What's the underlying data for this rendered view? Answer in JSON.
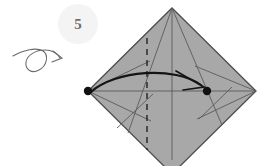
{
  "figure": {
    "kind": "origami-fold-diagram",
    "step_number": "5",
    "step_badge": {
      "shape": "circle",
      "center_x": 78,
      "center_y": 24,
      "radius": 20,
      "fill": "#f2f2f2"
    },
    "turn_over_symbol": {
      "name": "turn-over-arrow",
      "description": "loop arrow indicating turn the paper over",
      "stroke": "#6b6b6b"
    },
    "colors": {
      "paper_fill": "#a8a8a8",
      "paper_edge": "#4d4d4d",
      "crease_line": "#5a5a5a",
      "valley_dash": "#2b2b2b",
      "action_arrow": "#1a1a1a",
      "reference_dot": "#111111",
      "background": "#ffffff",
      "badge_fill": "#f2f2f2",
      "badge_text": "#6e6e6e"
    },
    "shape": {
      "name": "diamond-paper",
      "vertices": [
        {
          "name": "top",
          "x": 172,
          "y": 8
        },
        {
          "name": "right",
          "x": 256,
          "y": 91
        },
        {
          "name": "bottom",
          "x": 172,
          "y": 174
        },
        {
          "name": "left",
          "x": 88,
          "y": 91
        }
      ]
    },
    "reference_dots": [
      {
        "name": "left-reference-dot",
        "x": 88,
        "y": 91,
        "r": 4.2
      },
      {
        "name": "right-reference-dot",
        "x": 207,
        "y": 91,
        "r": 4.2
      }
    ],
    "creases": [
      {
        "name": "horizontal-center-crease",
        "x1": 88,
        "y1": 91,
        "x2": 256,
        "y2": 91,
        "style": "solid"
      },
      {
        "name": "vertical-center-crease",
        "x1": 172,
        "y1": 8,
        "x2": 172,
        "y2": 160,
        "style": "solid"
      },
      {
        "name": "diagonal-top-to-left-lower",
        "x1": 172,
        "y1": 8,
        "x2": 128,
        "y2": 133,
        "style": "solid"
      },
      {
        "name": "diagonal-top-to-right-lower",
        "x1": 172,
        "y1": 8,
        "x2": 222,
        "y2": 125,
        "style": "solid"
      },
      {
        "name": "left-fold-edge-upper",
        "x1": 88,
        "y1": 91,
        "x2": 147,
        "y2": 62,
        "style": "solid"
      },
      {
        "name": "left-fold-edge-lower",
        "x1": 88,
        "y1": 91,
        "x2": 150,
        "y2": 120,
        "style": "solid"
      },
      {
        "name": "right-kite-crease-upper",
        "x1": 256,
        "y1": 91,
        "x2": 196,
        "y2": 66,
        "style": "solid"
      },
      {
        "name": "right-kite-crease-lower",
        "x1": 256,
        "y1": 91,
        "x2": 198,
        "y2": 118,
        "style": "solid"
      },
      {
        "name": "lower-left-cross-crease",
        "x1": 118,
        "y1": 127,
        "x2": 152,
        "y2": 95,
        "style": "solid"
      },
      {
        "name": "lower-right-cross-crease",
        "x1": 200,
        "y1": 118,
        "x2": 231,
        "y2": 88,
        "style": "solid"
      }
    ],
    "valley_fold": {
      "name": "vertical-valley-fold",
      "x": 147,
      "y1": 38,
      "y2": 150,
      "style": "dashed"
    },
    "action_arrow": {
      "name": "fold-direction-arrow",
      "from": {
        "x": 92,
        "y": 92
      },
      "to": {
        "x": 203,
        "y": 86
      },
      "apex": {
        "x": 150,
        "y": 72
      },
      "style": "curved-with-arrowhead"
    }
  }
}
